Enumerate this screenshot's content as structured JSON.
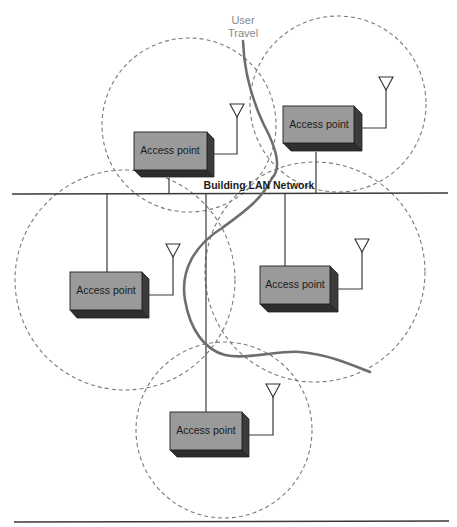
{
  "diagram": {
    "lan_label": "Building LAN Network",
    "travel_label_line1": "User",
    "travel_label_line2": "Travel",
    "access_points": [
      {
        "id": "ap-top-left",
        "label": "Access point"
      },
      {
        "id": "ap-top-right",
        "label": "Access point"
      },
      {
        "id": "ap-middle-left",
        "label": "Access point"
      },
      {
        "id": "ap-middle-right",
        "label": "Access point"
      },
      {
        "id": "ap-bottom",
        "label": "Access point"
      }
    ],
    "colors": {
      "ap_front": "#9a9a9a",
      "ap_shadow": "#3c3c3c",
      "coverage_stroke": "#7a7a7a",
      "travel_path": "#6e6e6e",
      "travel_label": "#8a8a8a"
    }
  }
}
